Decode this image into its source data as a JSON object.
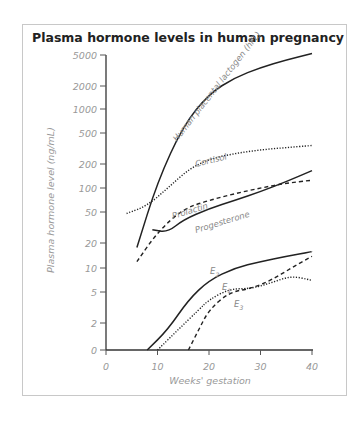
{
  "chart_data": {
    "type": "line",
    "title": "Plasma hormone levels in human pregnancy",
    "xlabel": "Weeks' gestation",
    "ylabel": "Plasma hormone level (ng/mL)",
    "yscale": "log",
    "xlim": [
      0,
      40
    ],
    "x_ticks": [
      "0",
      "10",
      "20",
      "30",
      "40"
    ],
    "y_ticks": [
      "5000",
      "2000",
      "1000",
      "500",
      "200",
      "100",
      "50",
      "20",
      "10",
      "5",
      "2",
      "0"
    ],
    "grid": false,
    "legend": "inline labels",
    "series": [
      {
        "name": "Human placental lactogen (hPL)",
        "style": "solid",
        "x": [
          6,
          10,
          15,
          20,
          25,
          30,
          35,
          40
        ],
        "values": [
          18,
          120,
          600,
          1500,
          2400,
          3200,
          4000,
          4800
        ]
      },
      {
        "name": "Cortisol",
        "style": "dotted",
        "x": [
          4,
          8,
          12,
          16,
          20,
          25,
          30,
          35,
          40
        ],
        "values": [
          48,
          60,
          100,
          170,
          230,
          270,
          300,
          320,
          340
        ]
      },
      {
        "name": "Prolactin",
        "style": "dashed",
        "x": [
          6,
          10,
          15,
          20,
          25,
          30,
          35,
          40
        ],
        "values": [
          12,
          28,
          55,
          70,
          85,
          100,
          115,
          125
        ]
      },
      {
        "name": "Progesterone",
        "style": "solid",
        "x": [
          9,
          12,
          15,
          20,
          25,
          30,
          35,
          40
        ],
        "values": [
          30,
          28,
          40,
          55,
          70,
          90,
          120,
          165
        ]
      },
      {
        "name": "E2",
        "style": "solid",
        "x": [
          8,
          12,
          16,
          20,
          25,
          30,
          35,
          40
        ],
        "values": [
          0,
          1.5,
          4,
          7,
          10,
          12,
          14,
          16
        ]
      },
      {
        "name": "E1",
        "style": "dotted",
        "x": [
          10,
          14,
          18,
          20,
          24,
          28,
          32,
          36,
          40
        ],
        "values": [
          0,
          1.5,
          3,
          4,
          5.5,
          5.5,
          6.5,
          8,
          7
        ]
      },
      {
        "name": "E3",
        "style": "dashed",
        "x": [
          16,
          18,
          20,
          24,
          28,
          32,
          36,
          40
        ],
        "values": [
          0,
          1.5,
          3,
          5,
          5.5,
          7,
          10,
          14
        ]
      }
    ],
    "annotations": [
      "Human placental lactogen (hPL)",
      "Cortisol",
      "Prolactin",
      "Progesterone",
      "E2",
      "E1",
      "E3"
    ]
  },
  "labels": {
    "hpl": "Human placental lactogen (hPL)",
    "cortisol": "Cortisol",
    "prolactin": "Prolactin",
    "progesterone": "Progesterone",
    "e2": "E",
    "e2_sub": "2",
    "e1": "E",
    "e1_sub": "1",
    "e3": "E",
    "e3_sub": "3"
  }
}
